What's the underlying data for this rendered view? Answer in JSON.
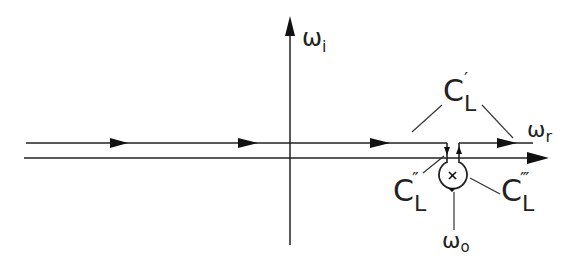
{
  "diagram": {
    "type": "complex-plane contour diagram",
    "axes": {
      "vertical_label": "ω",
      "vertical_subscript": "i",
      "horizontal_label": "ω",
      "horizontal_subscript": "r"
    },
    "contour_labels": [
      {
        "id": "C_L_prime",
        "base": "C",
        "subscript": "L",
        "prime": "′"
      },
      {
        "id": "C_L_double_prime",
        "base": "C",
        "subscript": "L",
        "prime": "″"
      },
      {
        "id": "C_L_triple_prime",
        "base": "C",
        "subscript": "L",
        "prime": "‴"
      }
    ],
    "pole": {
      "marker": "×",
      "label": "ω",
      "subscript": "o"
    }
  }
}
